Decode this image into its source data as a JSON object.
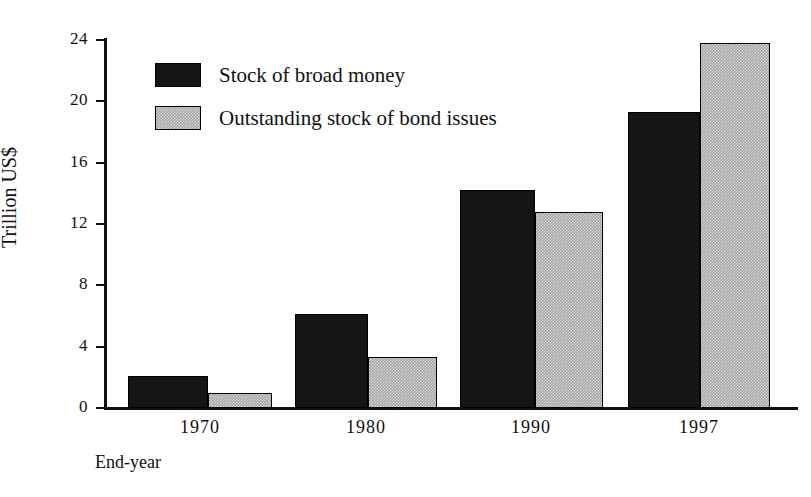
{
  "chart_data": {
    "type": "bar",
    "title": "",
    "subtitle": "",
    "xlabel": "End-year",
    "ylabel": "Trillion US$",
    "categories": [
      "1970",
      "1980",
      "1990",
      "1997"
    ],
    "series": [
      {
        "name": "Stock of broad money",
        "values": [
          2.1,
          6.1,
          14.2,
          19.3
        ],
        "color": "#151515"
      },
      {
        "name": "Outstanding stock of bond issues",
        "values": [
          1.0,
          3.3,
          12.8,
          23.8
        ],
        "color": "#a5a5a5"
      }
    ],
    "ylim": [
      0,
      24
    ],
    "yticks": [
      0,
      4,
      8,
      12,
      16,
      20,
      24
    ],
    "ytick_labels": [
      "0",
      "4",
      "8",
      "12",
      "16",
      "20",
      "24"
    ],
    "grid": false,
    "legend_position": "upper-left",
    "annotations": []
  },
  "legend": {
    "entries": [
      {
        "label": "Stock of broad money",
        "swatch": "solid-black-swatch"
      },
      {
        "label": "Outstanding stock of bond issues",
        "swatch": "halftone-gray-swatch"
      }
    ]
  },
  "axes": {
    "y_title": "Trillion US$",
    "x_title": "End-year"
  }
}
